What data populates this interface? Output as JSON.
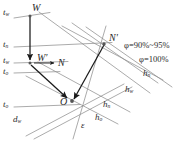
{
  "diagram": {
    "type": "h-d diagram (enthalpy-moisture content)",
    "line_color": "#8a8a8a",
    "arrow_color": "#1a1a1a",
    "text_color": "#2b2b2b",
    "background": "#ffffff"
  },
  "temperature_labels": [
    {
      "id": "t-w-top",
      "base": "t",
      "sub": "w",
      "text": "t",
      "x": 3,
      "y": 10
    },
    {
      "id": "t-n",
      "base": "t",
      "sub": "n",
      "text": "t",
      "x": 3,
      "y": 42
    },
    {
      "id": "t-w-prime",
      "base": "t",
      "sub": "w",
      "text": "t",
      "x": 3,
      "y": 60
    },
    {
      "id": "t-o-mid",
      "base": "t",
      "sub": "o",
      "text": "t",
      "x": 3,
      "y": 71
    },
    {
      "id": "t-o-bottom",
      "base": "t",
      "sub": "o",
      "text": "t",
      "x": 3,
      "y": 103
    }
  ],
  "point_labels": [
    {
      "id": "point-W",
      "text": "W",
      "sub": "",
      "x": 32,
      "y": 6
    },
    {
      "id": "point-W-prime",
      "text": "W′",
      "sub": "",
      "x": 38,
      "y": 56
    },
    {
      "id": "point-N",
      "text": "N",
      "sub": "",
      "x": 60,
      "y": 61
    },
    {
      "id": "point-N-prime",
      "text": "N′",
      "sub": "",
      "x": 108,
      "y": 36
    },
    {
      "id": "point-O",
      "text": "O",
      "sub": "",
      "x": 62,
      "y": 102
    }
  ],
  "enthalpy_labels": [
    {
      "id": "h-n-right",
      "base": "h",
      "sub": "n",
      "x": 143,
      "y": 73
    },
    {
      "id": "h-w-right",
      "base": "h",
      "sub": "w",
      "x": 125,
      "y": 88
    },
    {
      "id": "h-n-lower",
      "base": "h",
      "sub": "n",
      "x": 104,
      "y": 104
    },
    {
      "id": "h-o-lower",
      "base": "h",
      "sub": "o",
      "x": 96,
      "y": 116
    }
  ],
  "humidity_labels": [
    {
      "id": "phi-90-95",
      "text": "φ=90%~95%",
      "x": 126,
      "y": 44
    },
    {
      "id": "phi-100",
      "text": "φ=100%",
      "x": 140,
      "y": 58
    }
  ],
  "axis_labels": [
    {
      "id": "d-w-label",
      "base": "d",
      "sub": "w",
      "x": 14,
      "y": 118
    },
    {
      "id": "epsilon-label",
      "text": "ε",
      "x": 82,
      "y": 124
    }
  ],
  "geometry": {
    "grid_lines": [
      {
        "name": "isotherm-tw-top",
        "x1": 14,
        "y1": 18,
        "x2": 48,
        "y2": 13
      },
      {
        "name": "isotherm-tn",
        "x1": 14,
        "y1": 47,
        "x2": 110,
        "y2": 43
      },
      {
        "name": "isotherm-twprime",
        "x1": 14,
        "y1": 63,
        "x2": 66,
        "y2": 62
      },
      {
        "name": "isotherm-to-mid",
        "x1": 14,
        "y1": 73,
        "x2": 58,
        "y2": 72
      },
      {
        "name": "isotherm-to-bottom",
        "x1": 14,
        "y1": 107,
        "x2": 76,
        "y2": 105
      },
      {
        "name": "enthalpy-hw",
        "x1": 41,
        "y1": 14,
        "x2": 148,
        "y2": 92
      },
      {
        "name": "enthalpy-hn",
        "x1": 64,
        "y1": 28,
        "x2": 160,
        "y2": 80
      },
      {
        "name": "enthalpy-hn2",
        "x1": 40,
        "y1": 64,
        "x2": 126,
        "y2": 110
      },
      {
        "name": "enthalpy-ho",
        "x1": 28,
        "y1": 76,
        "x2": 116,
        "y2": 122
      },
      {
        "name": "saturation-phi100",
        "x1": 88,
        "y1": 28,
        "x2": 168,
        "y2": 84
      },
      {
        "name": "saturation-phi95",
        "x1": 74,
        "y1": 25,
        "x2": 156,
        "y2": 82
      },
      {
        "name": "epsilon-ray",
        "x1": 104,
        "y1": 27,
        "x2": 74,
        "y2": 138
      },
      {
        "name": "d-axis",
        "x1": 28,
        "y1": 134,
        "x2": 120,
        "y2": 86
      }
    ],
    "process_arrows": [
      {
        "name": "arrow-W-to-Wprime",
        "x1": 30,
        "y1": 17,
        "x2": 30,
        "y2": 62
      },
      {
        "name": "arrow-Wprime-to-O",
        "x1": 31,
        "y1": 64,
        "x2": 69,
        "y2": 100
      },
      {
        "name": "arrow-Nprime-to-O",
        "x1": 104,
        "y1": 44,
        "x2": 72,
        "y2": 100
      },
      {
        "name": "arrow-Wprime-to-N",
        "x1": 33,
        "y1": 63,
        "x2": 57,
        "y2": 63
      }
    ],
    "node_markers": [
      {
        "name": "marker-W",
        "x": 30,
        "y": 16
      },
      {
        "name": "marker-Wprime",
        "x": 30,
        "y": 63
      },
      {
        "name": "marker-Nprime",
        "x": 104,
        "y": 44
      },
      {
        "name": "marker-O",
        "x": 72,
        "y": 101
      }
    ]
  }
}
